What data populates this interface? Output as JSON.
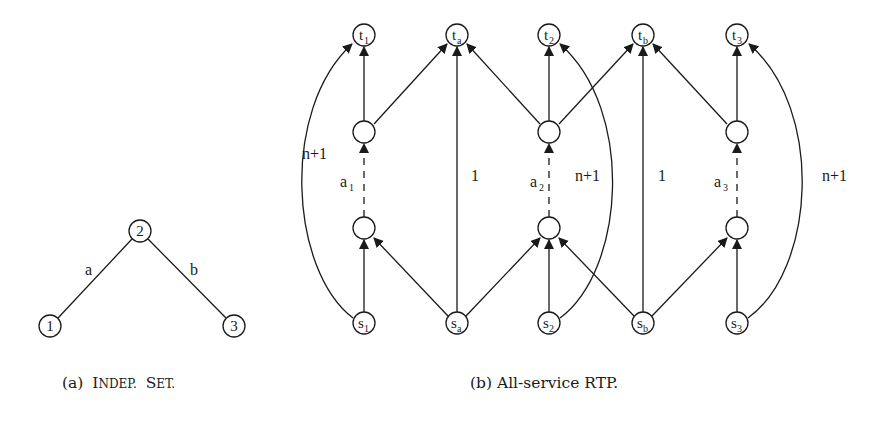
{
  "figure": {
    "panel_a": {
      "caption_prefix": "(a)",
      "caption_sc1_first": "I",
      "caption_sc1_rest": "NDEP.",
      "caption_sc2_first": "S",
      "caption_sc2_rest": "ET.",
      "nodes": [
        {
          "id": "1",
          "label": "1"
        },
        {
          "id": "2",
          "label": "2"
        },
        {
          "id": "3",
          "label": "3"
        }
      ],
      "edges": [
        {
          "from": "1",
          "to": "2",
          "label": "a"
        },
        {
          "from": "2",
          "to": "3",
          "label": "b"
        }
      ]
    },
    "panel_b": {
      "caption": "(b) All-service RTP.",
      "top_nodes": [
        {
          "base": "t",
          "sub": "1"
        },
        {
          "base": "t",
          "sub": "a"
        },
        {
          "base": "t",
          "sub": "2"
        },
        {
          "base": "t",
          "sub": "b"
        },
        {
          "base": "t",
          "sub": "3"
        }
      ],
      "bottom_nodes": [
        {
          "base": "s",
          "sub": "1"
        },
        {
          "base": "s",
          "sub": "a"
        },
        {
          "base": "s",
          "sub": "2"
        },
        {
          "base": "s",
          "sub": "b"
        },
        {
          "base": "s",
          "sub": "3"
        }
      ],
      "dashed_edge_labels": [
        {
          "base": "a",
          "sub": "1"
        },
        {
          "base": "a",
          "sub": "2"
        },
        {
          "base": "a",
          "sub": "3"
        }
      ],
      "edge_labels": {
        "curve_1": "n+1",
        "direct_a": "1",
        "curve_2": "n+1",
        "direct_b": "1",
        "curve_3": "n+1"
      }
    }
  }
}
